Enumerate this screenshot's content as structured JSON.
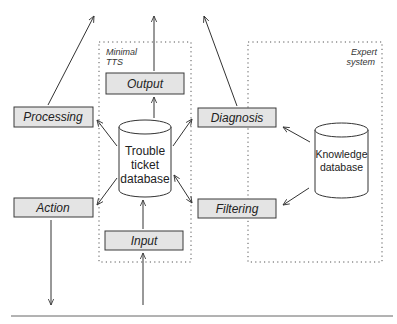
{
  "groups": {
    "minimal_tts": {
      "line1": "Minimal",
      "line2": "TTS"
    },
    "expert_system": {
      "line1": "Expert",
      "line2": "system"
    }
  },
  "boxes": {
    "output": "Output",
    "processing": "Processing",
    "diagnosis": "Diagnosis",
    "action": "Action",
    "filtering": "Filtering",
    "input": "Input"
  },
  "databases": {
    "trouble_ticket": {
      "line1": "Trouble",
      "line2": "ticket",
      "line3": "database"
    },
    "knowledge": {
      "line1": "Knowledge",
      "line2": "database"
    }
  },
  "colors": {
    "box_fill": "#e4e4e4",
    "stroke": "#333333",
    "background": "#ffffff"
  }
}
